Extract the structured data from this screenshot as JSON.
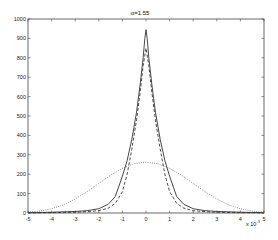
{
  "chart_data": {
    "type": "line",
    "title": "α=1.55",
    "xlabel": "",
    "ylabel": "",
    "x_multiplier_label": "x 10",
    "x_multiplier_exponent": "-3",
    "xlim": [
      -5,
      5
    ],
    "ylim": [
      0,
      1000
    ],
    "xticks": [
      -5,
      -4,
      -3,
      -2,
      -1,
      0,
      1,
      2,
      3,
      4,
      5
    ],
    "yticks": [
      0,
      100,
      200,
      300,
      400,
      500,
      600,
      700,
      800,
      900,
      1000
    ],
    "grid": false,
    "legend": null,
    "series": [
      {
        "name": "solid",
        "style": "solid",
        "x": [
          -5,
          -4,
          -3,
          -2.5,
          -2,
          -1.6,
          -1.3,
          -1.0,
          -0.8,
          -0.6,
          -0.4,
          -0.25,
          -0.12,
          -0.05,
          0,
          0.05,
          0.12,
          0.25,
          0.4,
          0.6,
          0.8,
          1.0,
          1.3,
          1.6,
          2,
          2.5,
          3,
          4,
          5
        ],
        "values": [
          2,
          4,
          8,
          12,
          22,
          45,
          85,
          190,
          270,
          380,
          520,
          660,
          800,
          900,
          945,
          900,
          800,
          660,
          520,
          380,
          270,
          190,
          85,
          45,
          22,
          12,
          8,
          4,
          2
        ]
      },
      {
        "name": "dashed",
        "style": "dashed",
        "x": [
          -5,
          -4,
          -3,
          -2.5,
          -2,
          -1.6,
          -1.3,
          -1.0,
          -0.8,
          -0.6,
          -0.4,
          -0.25,
          -0.12,
          0,
          0.12,
          0.25,
          0.4,
          0.6,
          0.8,
          1.0,
          1.3,
          1.6,
          2,
          2.5,
          3,
          4,
          5
        ],
        "values": [
          1,
          2,
          4,
          7,
          12,
          25,
          50,
          110,
          200,
          330,
          480,
          620,
          760,
          850,
          760,
          620,
          480,
          330,
          200,
          110,
          50,
          25,
          12,
          7,
          4,
          2,
          1
        ]
      },
      {
        "name": "dotted",
        "style": "dotted",
        "x": [
          -5,
          -4.5,
          -4,
          -3.5,
          -3,
          -2.5,
          -2,
          -1.5,
          -1,
          -0.5,
          0,
          0.5,
          1,
          1.5,
          2,
          2.5,
          3,
          3.5,
          4,
          4.5,
          5
        ],
        "values": [
          5,
          10,
          22,
          42,
          72,
          110,
          152,
          195,
          230,
          254,
          262,
          254,
          230,
          195,
          152,
          110,
          72,
          42,
          22,
          10,
          5
        ]
      }
    ]
  }
}
